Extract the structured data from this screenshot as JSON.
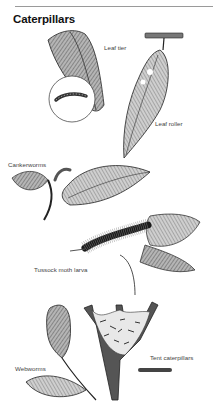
{
  "page": {
    "title": "Caterpillars"
  },
  "illustrations": [
    {
      "id": "leaf-tier",
      "label": "Leaf tier"
    },
    {
      "id": "leaf-roller",
      "label": "Leaf roller"
    },
    {
      "id": "cankerworms",
      "label": "Cankerworms"
    },
    {
      "id": "tussock-moth-larva",
      "label": "Tussock moth larva"
    },
    {
      "id": "webworms",
      "label": "Webworms"
    },
    {
      "id": "tent-caterpillars",
      "label": "Tent caterpillars"
    }
  ],
  "colors": {
    "ink": "#222222",
    "leaf_shade": "#8a8a8a",
    "label": "#444444",
    "rule": "#9a9a9a"
  }
}
